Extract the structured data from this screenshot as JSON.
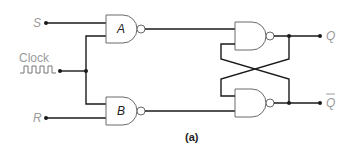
{
  "diagram": {
    "inputs": {
      "s": "S",
      "clock": "Clock",
      "r": "R"
    },
    "gates": {
      "a": "A",
      "b": "B"
    },
    "outputs": {
      "q": "Q",
      "qbar": "Q"
    },
    "caption": "(a)"
  }
}
